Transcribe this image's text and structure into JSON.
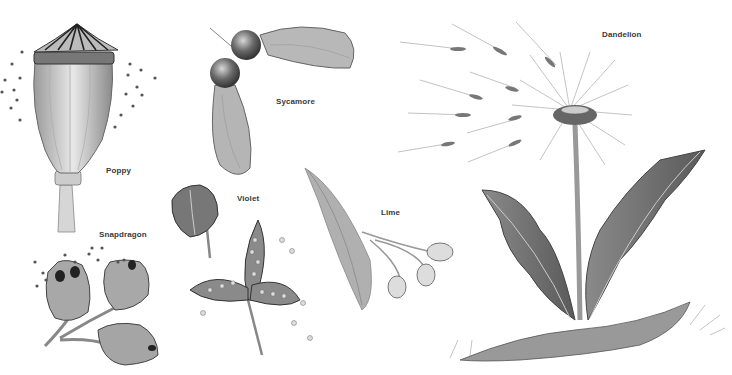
{
  "illustration": {
    "subject": "Botanical illustration of seed heads and seed dispersal",
    "labels": {
      "poppy": "Poppy",
      "sycamore": "Sycamore",
      "dandelion": "Dandelion",
      "snapdragon": "Snapdragon",
      "violet": "Violet",
      "lime": "Lime"
    },
    "colors": {
      "background": "#ffffff",
      "ink_dark": "#3a3a3a",
      "ink_mid": "#7a7a7a",
      "ink_light": "#b8b8b8"
    }
  }
}
